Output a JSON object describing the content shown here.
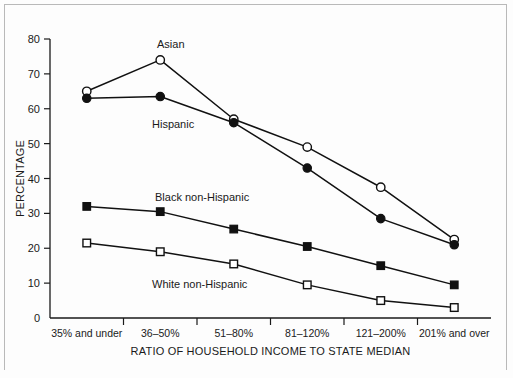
{
  "chart_data": {
    "type": "line",
    "title": "",
    "xlabel": "RATIO OF HOUSEHOLD INCOME TO STATE MEDIAN",
    "ylabel": "PERCENTAGE",
    "categories": [
      "35% and under",
      "36–50%",
      "51–80%",
      "81–120%",
      "121–200%",
      "201% and over"
    ],
    "ylim": [
      0,
      80
    ],
    "yticks": [
      0,
      10,
      20,
      30,
      40,
      50,
      60,
      70,
      80
    ],
    "ytick_labels": [
      "0",
      "10",
      "20",
      "30",
      "40",
      "50",
      "60",
      "70",
      "80"
    ],
    "grid": false,
    "legend_position": "inline-annotations",
    "series": [
      {
        "name": "Asian",
        "marker": "open-circle",
        "values": [
          65,
          74,
          57,
          49,
          37.5,
          22.5
        ]
      },
      {
        "name": "Hispanic",
        "marker": "filled-circle",
        "values": [
          63,
          63.5,
          56,
          43,
          28.5,
          21
        ]
      },
      {
        "name": "Black non-Hispanic",
        "marker": "filled-square",
        "values": [
          32,
          30.5,
          25.5,
          20.5,
          15,
          9.5
        ]
      },
      {
        "name": "White non-Hispanic",
        "marker": "open-square",
        "values": [
          21.5,
          19,
          15.5,
          9.5,
          5,
          3
        ]
      }
    ],
    "annotations": [
      {
        "text": "Asian",
        "x": 157,
        "y": 48
      },
      {
        "text": "Hispanic",
        "x": 152,
        "y": 128
      },
      {
        "text": "Black non-Hispanic",
        "x": 155,
        "y": 201
      },
      {
        "text": "White non-Hispanic",
        "x": 152,
        "y": 288
      }
    ],
    "colors": {
      "line": "#111111",
      "marker_fill": "#111111",
      "marker_open_fill": "#ffffff",
      "axis": "#1a1a1a",
      "background": "#fdfdfd",
      "frame": "#b9b9b9"
    }
  }
}
